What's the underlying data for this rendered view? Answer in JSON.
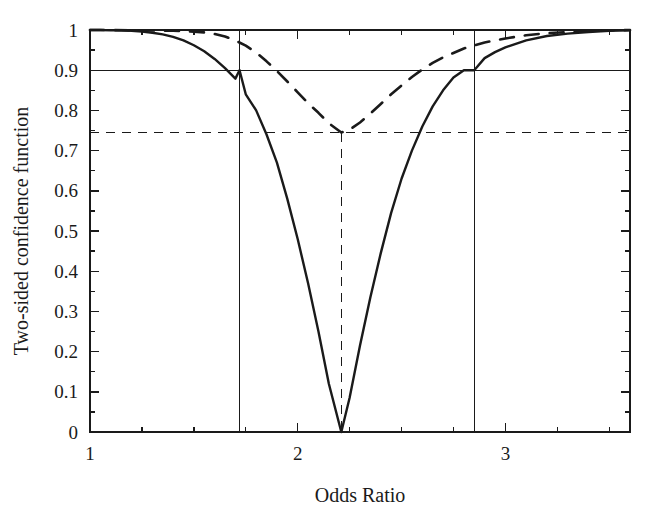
{
  "figure": {
    "background": "#ffffff",
    "ink_color": "#1a1a1a"
  },
  "chart_data": {
    "type": "line",
    "title": "",
    "xlabel": "Odds Ratio",
    "ylabel": "Two-sided confidence function",
    "xlim": [
      1,
      3.6
    ],
    "ylim": [
      0,
      1
    ],
    "grid": false,
    "legend": "none",
    "x_ticks_major": [
      1,
      2,
      3
    ],
    "x_tick_labels": [
      "1",
      "2",
      "3"
    ],
    "x_ticks_minor": [
      1.25,
      1.5,
      1.75,
      2.25,
      2.5,
      2.75,
      3.25,
      3.5
    ],
    "y_ticks_major": [
      0,
      0.1,
      0.2,
      0.3,
      0.4,
      0.5,
      0.6,
      0.7,
      0.8,
      0.9,
      1
    ],
    "y_tick_labels": [
      "0",
      "0.1",
      "0.2",
      "0.3",
      "0.4",
      "0.5",
      "0.6",
      "0.7",
      "0.8",
      "0.9",
      "1"
    ],
    "y_ticks_minor": [
      0.05,
      0.15,
      0.25,
      0.35,
      0.45,
      0.55,
      0.65,
      0.75,
      0.85,
      0.95
    ],
    "series": [
      {
        "name": "solid-confidence-function",
        "style": "solid",
        "point_estimate": 2.21,
        "minimum_value": 0.0,
        "x": [
          1.0,
          1.05,
          1.1,
          1.15,
          1.2,
          1.25,
          1.3,
          1.35,
          1.4,
          1.45,
          1.5,
          1.55,
          1.6,
          1.65,
          1.7,
          1.72,
          1.75,
          1.8,
          1.85,
          1.9,
          1.95,
          2.0,
          2.05,
          2.1,
          2.15,
          2.21,
          2.25,
          2.3,
          2.35,
          2.4,
          2.45,
          2.5,
          2.55,
          2.6,
          2.65,
          2.7,
          2.75,
          2.8,
          2.85,
          2.9,
          2.95,
          3.0,
          3.1,
          3.2,
          3.3,
          3.4,
          3.5,
          3.6
        ],
        "y": [
          1.0,
          1.0,
          0.999,
          0.999,
          0.998,
          0.996,
          0.993,
          0.989,
          0.983,
          0.974,
          0.962,
          0.947,
          0.928,
          0.905,
          0.879,
          0.9,
          0.84,
          0.8,
          0.74,
          0.67,
          0.58,
          0.48,
          0.37,
          0.25,
          0.12,
          0.0,
          0.085,
          0.215,
          0.335,
          0.445,
          0.545,
          0.63,
          0.7,
          0.76,
          0.81,
          0.85,
          0.882,
          0.9,
          0.9,
          0.93,
          0.945,
          0.957,
          0.974,
          0.985,
          0.991,
          0.995,
          0.998,
          0.999
        ]
      },
      {
        "name": "dashed-confidence-function",
        "style": "dashed",
        "point_estimate": 2.21,
        "minimum_value": 0.745,
        "x": [
          1.0,
          1.1,
          1.2,
          1.3,
          1.4,
          1.5,
          1.55,
          1.6,
          1.65,
          1.7,
          1.75,
          1.8,
          1.85,
          1.9,
          1.95,
          2.0,
          2.05,
          2.1,
          2.15,
          2.21,
          2.25,
          2.3,
          2.35,
          2.4,
          2.45,
          2.5,
          2.55,
          2.6,
          2.65,
          2.7,
          2.8,
          2.9,
          3.0,
          3.1,
          3.2,
          3.3,
          3.4,
          3.5,
          3.6
        ],
        "y": [
          1.0,
          1.0,
          0.999,
          0.999,
          0.998,
          0.996,
          0.994,
          0.99,
          0.984,
          0.974,
          0.961,
          0.944,
          0.922,
          0.898,
          0.872,
          0.845,
          0.818,
          0.794,
          0.768,
          0.745,
          0.752,
          0.77,
          0.792,
          0.816,
          0.84,
          0.862,
          0.883,
          0.902,
          0.918,
          0.932,
          0.954,
          0.969,
          0.979,
          0.987,
          0.992,
          0.995,
          0.997,
          0.999,
          1.0
        ]
      }
    ],
    "reference_lines": [
      {
        "name": "horizontal-0.9-line",
        "orientation": "horizontal",
        "value": 0.9,
        "style": "solid"
      },
      {
        "name": "vertical-lower-limit-line",
        "orientation": "vertical",
        "value": 1.72,
        "style": "solid"
      },
      {
        "name": "vertical-upper-limit-line",
        "orientation": "vertical",
        "value": 2.85,
        "style": "solid"
      },
      {
        "name": "horizontal-0.745-line",
        "orientation": "horizontal",
        "value": 0.745,
        "style": "dashed"
      },
      {
        "name": "vertical-point-estimate-line",
        "orientation": "vertical",
        "value": 2.21,
        "style": "dashed"
      }
    ]
  }
}
